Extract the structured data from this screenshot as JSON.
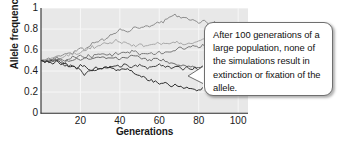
{
  "figure": {
    "axes": {
      "y_title": "Allele frequency",
      "x_title": "Generations",
      "y_ticks": [
        "1",
        "0.8",
        "0.6",
        "0.4",
        "0.2",
        "0"
      ],
      "x_ticks": [
        "20",
        "40",
        "60",
        "80",
        "100"
      ]
    },
    "callout": {
      "text": "After 100 generations of a large population, none of the simulations result in extinction or fixation of the allele."
    },
    "colors": {
      "plot_background": "#e8e8e8",
      "gridline": "#f7f7f7",
      "axis": "#2b2b2b",
      "callout_border": "#6f6f6f",
      "callout_background": "#ffffff",
      "text": "#1a1a1a"
    }
  },
  "chart_data": {
    "type": "line",
    "title": "",
    "xlabel": "Generations",
    "ylabel": "Allele frequency",
    "xlim": [
      0,
      105
    ],
    "ylim": [
      0,
      1
    ],
    "xticks": [
      20,
      40,
      60,
      80,
      100
    ],
    "yticks": [
      0,
      0.2,
      0.4,
      0.6,
      0.8,
      1
    ],
    "grid": true,
    "legend": "none",
    "x": [
      0,
      2,
      4,
      6,
      8,
      10,
      12,
      14,
      16,
      18,
      20,
      22,
      24,
      26,
      28,
      30,
      32,
      34,
      36,
      38,
      40,
      42,
      44,
      46,
      48,
      50,
      52,
      54,
      56,
      58,
      60,
      62,
      64,
      66,
      68,
      70,
      72,
      74,
      76,
      78,
      80,
      82,
      84,
      86,
      88,
      90,
      92,
      94,
      96,
      98,
      100
    ],
    "series": [
      {
        "name": "run-1",
        "color": "#8c8c8c",
        "values": [
          0.5,
          0.51,
          0.52,
          0.51,
          0.53,
          0.55,
          0.56,
          0.58,
          0.57,
          0.6,
          0.62,
          0.61,
          0.64,
          0.66,
          0.68,
          0.7,
          0.69,
          0.72,
          0.75,
          0.77,
          0.79,
          0.8,
          0.78,
          0.8,
          0.82,
          0.81,
          0.83,
          0.82,
          0.84,
          0.86,
          0.85,
          0.87,
          0.89,
          0.91,
          0.93,
          0.92,
          0.9,
          0.91,
          0.89,
          0.87,
          0.86,
          0.88,
          0.87,
          0.85,
          0.86,
          0.84,
          0.83,
          0.82,
          0.83,
          0.82,
          0.82
        ]
      },
      {
        "name": "run-2",
        "color": "#a8a8a8",
        "values": [
          0.5,
          0.51,
          0.5,
          0.52,
          0.53,
          0.52,
          0.54,
          0.55,
          0.57,
          0.56,
          0.58,
          0.6,
          0.61,
          0.63,
          0.62,
          0.64,
          0.66,
          0.65,
          0.67,
          0.69,
          0.68,
          0.67,
          0.66,
          0.65,
          0.64,
          0.65,
          0.64,
          0.63,
          0.64,
          0.66,
          0.67,
          0.66,
          0.65,
          0.66,
          0.68,
          0.67,
          0.66,
          0.65,
          0.66,
          0.67,
          0.68,
          0.7,
          0.69,
          0.71,
          0.7,
          0.72,
          0.71,
          0.7,
          0.72,
          0.73,
          0.72
        ]
      },
      {
        "name": "run-3",
        "color": "#7a7a7a",
        "values": [
          0.5,
          0.49,
          0.51,
          0.5,
          0.52,
          0.51,
          0.5,
          0.52,
          0.53,
          0.52,
          0.54,
          0.53,
          0.55,
          0.54,
          0.56,
          0.55,
          0.57,
          0.56,
          0.55,
          0.57,
          0.56,
          0.58,
          0.57,
          0.59,
          0.58,
          0.56,
          0.57,
          0.55,
          0.57,
          0.56,
          0.58,
          0.57,
          0.59,
          0.58,
          0.6,
          0.62,
          0.61,
          0.63,
          0.62,
          0.64,
          0.63,
          0.65,
          0.64,
          0.66,
          0.65,
          0.67,
          0.66,
          0.68,
          0.67,
          0.69,
          0.68
        ]
      },
      {
        "name": "run-4",
        "color": "#6b6b6b",
        "values": [
          0.5,
          0.5,
          0.49,
          0.51,
          0.5,
          0.49,
          0.48,
          0.5,
          0.49,
          0.51,
          0.5,
          0.52,
          0.51,
          0.53,
          0.52,
          0.54,
          0.53,
          0.52,
          0.51,
          0.53,
          0.52,
          0.54,
          0.53,
          0.55,
          0.54,
          0.53,
          0.52,
          0.51,
          0.5,
          0.52,
          0.51,
          0.5,
          0.49,
          0.48,
          0.47,
          0.46,
          0.45,
          0.44,
          0.45,
          0.44,
          0.43,
          0.44,
          0.45,
          0.44,
          0.43,
          0.44,
          0.43,
          0.44,
          0.45,
          0.44,
          0.44
        ]
      },
      {
        "name": "run-5",
        "color": "#3d3d3d",
        "values": [
          0.5,
          0.49,
          0.48,
          0.5,
          0.49,
          0.47,
          0.46,
          0.45,
          0.44,
          0.43,
          0.42,
          0.35,
          0.4,
          0.42,
          0.41,
          0.43,
          0.42,
          0.44,
          0.43,
          0.45,
          0.44,
          0.46,
          0.45,
          0.44,
          0.46,
          0.45,
          0.44,
          0.43,
          0.45,
          0.44,
          0.46,
          0.45,
          0.44,
          0.43,
          0.44,
          0.43,
          0.42,
          0.43,
          0.42,
          0.43,
          0.42,
          0.43,
          0.44,
          0.43,
          0.44,
          0.43,
          0.44,
          0.43,
          0.44,
          0.43,
          0.43
        ]
      },
      {
        "name": "run-6",
        "color": "#2e2e2e",
        "values": [
          0.5,
          0.49,
          0.48,
          0.47,
          0.49,
          0.48,
          0.46,
          0.45,
          0.44,
          0.43,
          0.45,
          0.44,
          0.42,
          0.41,
          0.43,
          0.42,
          0.44,
          0.43,
          0.42,
          0.41,
          0.4,
          0.42,
          0.41,
          0.39,
          0.38,
          0.36,
          0.34,
          0.32,
          0.31,
          0.3,
          0.28,
          0.29,
          0.27,
          0.26,
          0.27,
          0.25,
          0.24,
          0.25,
          0.23,
          0.22,
          0.22,
          0.23,
          0.22,
          0.24,
          0.23,
          0.22,
          0.23,
          0.22,
          0.23,
          0.22,
          0.22
        ]
      }
    ]
  }
}
